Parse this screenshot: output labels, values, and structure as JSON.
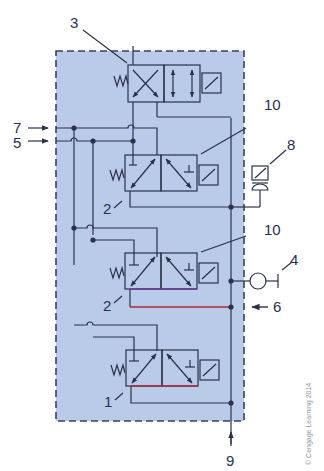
{
  "diagram": {
    "type": "pneumatic/hydraulic circuit schematic",
    "colors": {
      "panel_fill": "#b9cbe9",
      "panel_border": "#3a4358",
      "line": "#2b3248",
      "red_line": "#b0283c",
      "purple_line": "#6a3a9a"
    },
    "labels": {
      "l1": "1",
      "l2a": "2",
      "l2b": "2",
      "l3": "3",
      "l4": "4",
      "l5": "5",
      "l6": "6",
      "l7": "7",
      "l8": "8",
      "l9": "9",
      "l10a": "10",
      "l10b": "10"
    },
    "components": [
      {
        "id": "3",
        "name": "4/2 solenoid valve with spring return (crossed / parallel paths)"
      },
      {
        "id": "2",
        "name": "3/2 solenoid valve (upper)"
      },
      {
        "id": "2",
        "name": "3/2 solenoid valve (middle)"
      },
      {
        "id": "1",
        "name": "3/2 solenoid valve (lower)"
      },
      {
        "id": "10",
        "name": "solenoid actuator pointer"
      },
      {
        "id": "8",
        "name": "pressure switch"
      },
      {
        "id": "4",
        "name": "pressure gauge / test point"
      },
      {
        "id": "5",
        "name": "input port"
      },
      {
        "id": "6",
        "name": "input port"
      },
      {
        "id": "7",
        "name": "input port"
      },
      {
        "id": "9",
        "name": "supply port"
      }
    ],
    "copyright": "© Cengage Learning 2014"
  }
}
